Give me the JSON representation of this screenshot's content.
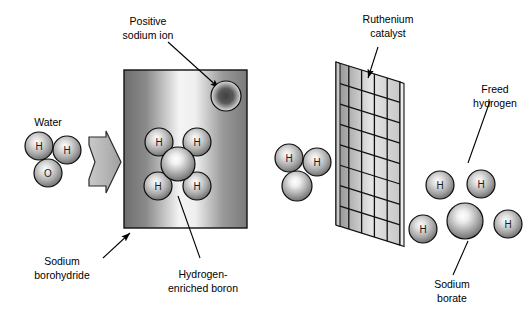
{
  "figure": {
    "background_color": "#ffffff",
    "line_color": "#000000",
    "width": 531,
    "height": 312
  },
  "labels": {
    "positive_sodium_ion": {
      "line1": "Positive",
      "line2": "sodium ion"
    },
    "ruthenium_catalyst": {
      "line1": "Ruthenium",
      "line2": "catalyst"
    },
    "freed_hydrogen": {
      "line1": "Freed",
      "line2": "hydrogen"
    },
    "water": {
      "line1": "Water"
    },
    "sodium_borohydride": {
      "line1": "Sodium",
      "line2": "borohydride"
    },
    "hydrogen_enriched_boron": {
      "line1": "Hydrogen-",
      "line2": "enriched boron"
    },
    "sodium_borate": {
      "line1": "Sodium",
      "line2": "borate"
    }
  },
  "atoms": {
    "hydrogen_symbol": "H",
    "oxygen_symbol": "O",
    "boron_symbol": "",
    "sodium_symbol": ""
  },
  "molecules": {
    "water": {
      "name": "Water molecule",
      "atoms": [
        {
          "symbol": "H",
          "cx": 39,
          "cy": 146,
          "r": 14,
          "kind": "hydrogen"
        },
        {
          "symbol": "H",
          "cx": 67,
          "cy": 150,
          "r": 14,
          "kind": "hydrogen"
        },
        {
          "symbol": "O",
          "cx": 48,
          "cy": 173,
          "r": 14,
          "kind": "oxygen"
        }
      ]
    },
    "sodium_borohydride_cluster": {
      "name": "Hydrogen-enriched boron in sodium borohydride",
      "atoms": [
        {
          "symbol": "H",
          "cx": 159,
          "cy": 142,
          "r": 14,
          "kind": "hydrogen"
        },
        {
          "symbol": "H",
          "cx": 197,
          "cy": 142,
          "r": 14,
          "kind": "hydrogen"
        },
        {
          "symbol": "",
          "cx": 178,
          "cy": 164,
          "r": 17,
          "kind": "boron"
        },
        {
          "symbol": "H",
          "cx": 158,
          "cy": 186,
          "r": 14,
          "kind": "hydrogen"
        },
        {
          "symbol": "H",
          "cx": 197,
          "cy": 186,
          "r": 14,
          "kind": "hydrogen"
        }
      ]
    },
    "sodium_ion": {
      "name": "Positive sodium ion",
      "atoms": [
        {
          "symbol": "",
          "cx": 226,
          "cy": 96,
          "r": 15,
          "kind": "sodium"
        }
      ]
    },
    "water_after": {
      "name": "Water molecule approaching catalyst",
      "atoms": [
        {
          "symbol": "H",
          "cx": 289,
          "cy": 158,
          "r": 14,
          "kind": "hydrogen"
        },
        {
          "symbol": "H",
          "cx": 317,
          "cy": 162,
          "r": 14,
          "kind": "hydrogen"
        },
        {
          "symbol": "",
          "cx": 297,
          "cy": 186,
          "r": 15,
          "kind": "boron"
        }
      ]
    },
    "sodium_borate_cluster": {
      "name": "Sodium borate product",
      "atoms": [
        {
          "symbol": "H",
          "cx": 440,
          "cy": 185,
          "r": 14,
          "kind": "hydrogen"
        },
        {
          "symbol": "H",
          "cx": 481,
          "cy": 184,
          "r": 14,
          "kind": "hydrogen"
        },
        {
          "symbol": "H",
          "cx": 423,
          "cy": 229,
          "r": 14,
          "kind": "hydrogen"
        },
        {
          "symbol": "",
          "cx": 465,
          "cy": 221,
          "r": 18,
          "kind": "boron"
        },
        {
          "symbol": "H",
          "cx": 508,
          "cy": 224,
          "r": 14,
          "kind": "hydrogen"
        }
      ]
    }
  },
  "shapes": {
    "borohydride_box": {
      "x": 124,
      "y": 70,
      "width": 123,
      "height": 158
    },
    "flow_arrow": {
      "x": 88,
      "y": 131,
      "width": 34,
      "height": 62
    },
    "catalyst_grid": {
      "cols": 5,
      "rows": 8
    }
  },
  "colors": {
    "ink": "#000000",
    "box_dark": "#6e6e6e",
    "box_light": "#f2f2f2",
    "arrow_fill": "#b7b7b7",
    "atom_light": "#ffffff",
    "atom_mid": "#b0b0b0",
    "atom_dark": "#4a4a4a",
    "sodium_dark": "#3a3a3a",
    "grid_fill": "#d8d8d8"
  }
}
